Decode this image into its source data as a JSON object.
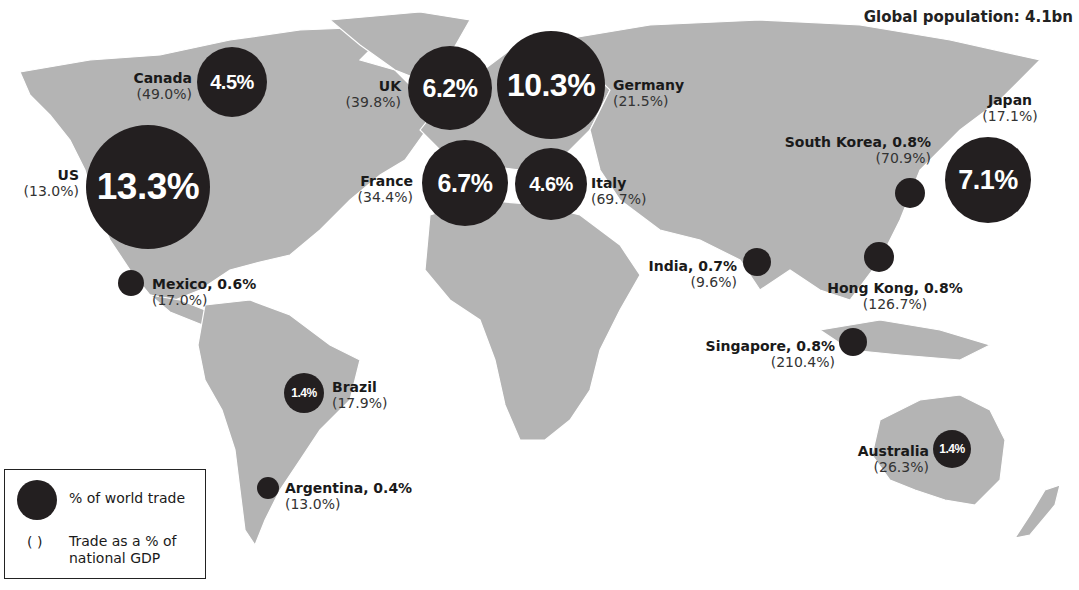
{
  "header": {
    "title": "Global population: 4.1bn"
  },
  "legend": {
    "bubble_label": "% of world trade",
    "paren_symbol": "( )",
    "paren_label": "Trade as a % of national GDP"
  },
  "colors": {
    "bubble": "#231f20",
    "land": "#b4b4b4",
    "borders": "#ffffff",
    "background": "#ffffff"
  },
  "countries": {
    "us": {
      "name": "US",
      "trade": "13.3%",
      "gdp": "(13.0%)"
    },
    "canada": {
      "name": "Canada",
      "trade": "4.5%",
      "gdp": "(49.0%)"
    },
    "uk": {
      "name": "UK",
      "trade": "6.2%",
      "gdp": "(39.8%)"
    },
    "germany": {
      "name": "Germany",
      "trade": "10.3%",
      "gdp": "(21.5%)"
    },
    "france": {
      "name": "France",
      "trade": "6.7%",
      "gdp": "(34.4%)"
    },
    "italy": {
      "name": "Italy",
      "trade": "4.6%",
      "gdp": "(69.7%)"
    },
    "japan": {
      "name": "Japan",
      "trade": "7.1%",
      "gdp": "(17.1%)"
    },
    "south_korea": {
      "name": "South Korea, 0.8%",
      "trade": "0.8%",
      "gdp": "(70.9%)"
    },
    "india": {
      "name": "India, 0.7%",
      "trade": "0.7%",
      "gdp": "(9.6%)"
    },
    "hong_kong": {
      "name": "Hong Kong, 0.8%",
      "trade": "0.8%",
      "gdp": "(126.7%)"
    },
    "singapore": {
      "name": "Singapore, 0.8%",
      "trade": "0.8%",
      "gdp": "(210.4%)"
    },
    "mexico": {
      "name": "Mexico, 0.6%",
      "trade": "0.6%",
      "gdp": "(17.0%)"
    },
    "brazil": {
      "name": "Brazil",
      "trade": "1.4%",
      "gdp": "(17.9%)"
    },
    "argentina": {
      "name": "Argentina, 0.4%",
      "trade": "0.4%",
      "gdp": "(13.0%)"
    },
    "australia": {
      "name": "Australia",
      "trade": "1.4%",
      "gdp": "(26.3%)"
    }
  }
}
